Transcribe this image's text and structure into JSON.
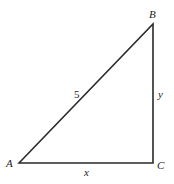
{
  "diagram": {
    "type": "right-triangle",
    "stroke_color": "#2a2a2a",
    "vertices": [
      {
        "name": "A",
        "x": 19,
        "y": 163
      },
      {
        "name": "B",
        "x": 153,
        "y": 24
      },
      {
        "name": "C",
        "x": 153,
        "y": 163
      }
    ],
    "labels": {
      "vertex_a": "A",
      "vertex_b": "B",
      "vertex_c": "C",
      "hypotenuse": "5",
      "vertical_leg": "y",
      "horizontal_leg": "x"
    },
    "sides": [
      {
        "from": "A",
        "to": "B",
        "label": "5"
      },
      {
        "from": "B",
        "to": "C",
        "label": "y"
      },
      {
        "from": "A",
        "to": "C",
        "label": "x"
      }
    ]
  }
}
